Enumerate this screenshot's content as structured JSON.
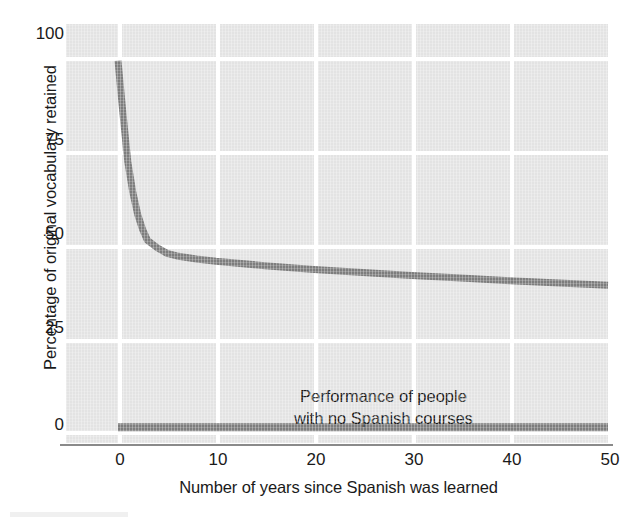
{
  "chart_data": {
    "type": "line",
    "title": "",
    "xlabel": "Number of years since Spanish was learned",
    "ylabel": "Percentage of original vocabulary retained",
    "xlim": [
      -5,
      55
    ],
    "ylim": [
      0,
      110
    ],
    "xticks": [
      0,
      10,
      20,
      30,
      40,
      50
    ],
    "xtick_labels": [
      "0",
      "10",
      "20",
      "30",
      "40",
      "50"
    ],
    "yticks": [
      0,
      25,
      50,
      75,
      100
    ],
    "ytick_labels": [
      "0",
      "25",
      "50",
      "75",
      "100"
    ],
    "grid": "white gridlines on light gray panel",
    "legend": "none",
    "series": [
      {
        "name": "Percentage of original vocabulary retained",
        "color": "#7d7d7d",
        "x": [
          0,
          0.5,
          1,
          1.5,
          2,
          2.5,
          3,
          4,
          5,
          6,
          8,
          10,
          15,
          20,
          25,
          30,
          35,
          40,
          45,
          50
        ],
        "values": [
          99,
          85,
          72,
          64,
          58,
          54,
          51,
          49,
          47.5,
          46.8,
          46,
          45.4,
          44.2,
          43.2,
          42.4,
          41.6,
          40.9,
          40.2,
          39.6,
          39
        ]
      },
      {
        "name": "Performance of people with no Spanish courses",
        "color": "#7d7d7d",
        "x": [
          0,
          50
        ],
        "values": [
          1,
          1
        ]
      }
    ],
    "annotations": [
      {
        "name": "no-courses-annotation",
        "line1": "Performance of people",
        "line2": "with no Spanish courses",
        "x": 23,
        "y": 12
      }
    ]
  },
  "axes": {
    "y_title": "Percentage of original vocabulary retained",
    "x_title": "Number of years since Spanish was learned",
    "y_ticks": [
      {
        "label": "100",
        "value": 100
      },
      {
        "label": "75",
        "value": 75
      },
      {
        "label": "50",
        "value": 50
      },
      {
        "label": "25",
        "value": 25
      },
      {
        "label": "0",
        "value": 0
      }
    ],
    "x_ticks": [
      {
        "label": "0",
        "value": 0
      },
      {
        "label": "10",
        "value": 10
      },
      {
        "label": "20",
        "value": 20
      },
      {
        "label": "30",
        "value": 30
      },
      {
        "label": "40",
        "value": 40
      },
      {
        "label": "50",
        "value": 50
      }
    ]
  },
  "annotation": {
    "line1": "Performance of people",
    "line2": "with no Spanish courses"
  },
  "colors": {
    "panel_background": "#e3e3e3",
    "gridline": "#ffffff",
    "curve": "#7d7d7d",
    "baseline_curve": "#7d7d7d",
    "axis_line": "#8a8a8a",
    "text": "#1a1a1a",
    "page_background": "#ffffff"
  }
}
